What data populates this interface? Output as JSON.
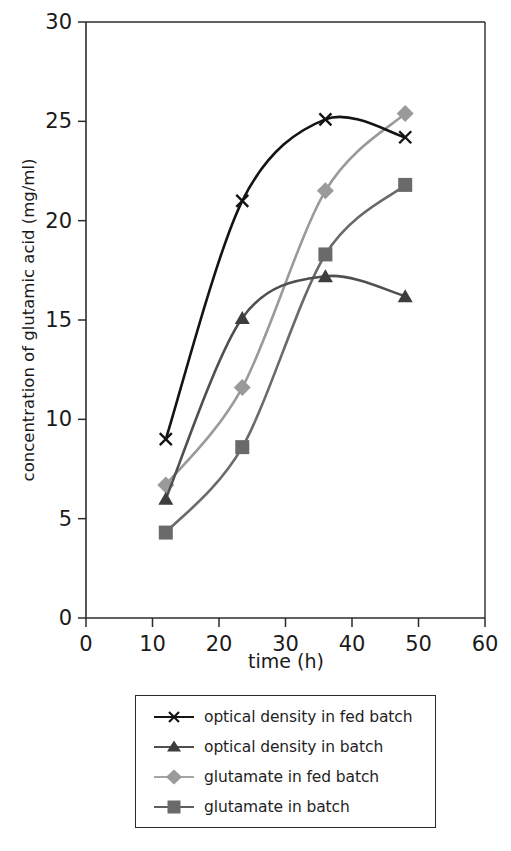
{
  "chart_data": {
    "type": "line",
    "title": "",
    "xlabel": "time (h)",
    "ylabel": "concentration of glutamic acid (mg/ml)",
    "xlim": [
      0,
      60
    ],
    "ylim": [
      0,
      30
    ],
    "xticks": [
      "0",
      "10",
      "20",
      "30",
      "40",
      "50",
      "60"
    ],
    "yticks": [
      "0",
      "5",
      "10",
      "15",
      "20",
      "25",
      "30"
    ],
    "xtick_values": [
      0,
      10,
      20,
      30,
      40,
      50,
      60
    ],
    "ytick_values": [
      0,
      5,
      10,
      15,
      20,
      25,
      30
    ],
    "grid": false,
    "legend_position": "below-plot",
    "series": [
      {
        "name": "optical density in fed batch",
        "marker": "x-cross",
        "color": "#141414",
        "x": [
          12,
          23.5,
          36,
          48
        ],
        "values": [
          9.0,
          21.0,
          25.1,
          24.2
        ]
      },
      {
        "name": "optical density in batch",
        "marker": "triangle",
        "color": "#4f4f4f",
        "x": [
          12,
          23.5,
          36,
          48
        ],
        "values": [
          6.0,
          15.1,
          17.2,
          16.2
        ]
      },
      {
        "name": "glutamate in fed batch",
        "marker": "diamond",
        "color": "#9a9a9a",
        "x": [
          12,
          23.5,
          36,
          48
        ],
        "values": [
          6.7,
          11.6,
          21.5,
          25.4
        ]
      },
      {
        "name": "glutamate in batch",
        "marker": "square",
        "color": "#6a6a6a",
        "x": [
          12,
          23.5,
          36,
          48
        ],
        "values": [
          4.3,
          8.6,
          18.3,
          21.8
        ]
      }
    ]
  },
  "axes": {
    "x_label": "time (h)",
    "y_label": "concentration of glutamic acid (mg/ml)"
  },
  "legend": {
    "items": [
      {
        "label": "optical density in fed batch",
        "marker": "x-cross",
        "color": "#141414"
      },
      {
        "label": "optical density in batch",
        "marker": "triangle",
        "color": "#4f4f4f"
      },
      {
        "label": "glutamate in fed batch",
        "marker": "diamond",
        "color": "#9a9a9a"
      },
      {
        "label": "glutamate in batch",
        "marker": "square",
        "color": "#6a6a6a"
      }
    ]
  }
}
